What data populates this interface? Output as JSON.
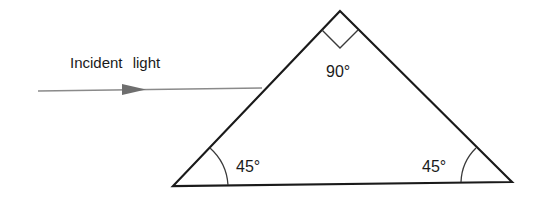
{
  "diagram": {
    "type": "optics-prism",
    "colors": {
      "stroke": "#1a1a1a",
      "ray": "#8a8a8a",
      "background": "#ffffff"
    },
    "incident_ray": {
      "label": "Incident light",
      "direction": "left-to-right"
    },
    "prism": {
      "shape": "right isosceles triangle",
      "apex_angle": {
        "label": "90°",
        "value": 90,
        "marker": "right-angle square"
      },
      "bottom_left_angle": {
        "label": "45°",
        "value": 45,
        "marker": "arc"
      },
      "bottom_right_angle": {
        "label": "45°",
        "value": 45,
        "marker": "arc"
      }
    }
  }
}
